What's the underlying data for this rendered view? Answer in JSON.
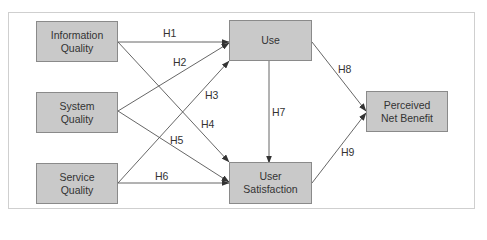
{
  "diagram": {
    "type": "path-model",
    "nodes": [
      {
        "id": "info",
        "line1": "Information",
        "line2": "Quality"
      },
      {
        "id": "sys",
        "line1": "System",
        "line2": "Quality"
      },
      {
        "id": "serv",
        "line1": "Service",
        "line2": "Quality"
      },
      {
        "id": "use",
        "line1": "Use",
        "line2": ""
      },
      {
        "id": "usat",
        "line1": "User",
        "line2": "Satisfaction"
      },
      {
        "id": "pnb",
        "line1": "Perceived",
        "line2": "Net Benefit"
      }
    ],
    "edges": [
      {
        "label": "H1",
        "from": "Information Quality",
        "to": "Use"
      },
      {
        "label": "H2",
        "from": "System Quality",
        "to": "Use"
      },
      {
        "label": "H3",
        "from": "Service Quality",
        "to": "Use"
      },
      {
        "label": "H4",
        "from": "Information Quality",
        "to": "User Satisfaction"
      },
      {
        "label": "H5",
        "from": "System Quality",
        "to": "User Satisfaction"
      },
      {
        "label": "H6",
        "from": "Service Quality",
        "to": "User Satisfaction"
      },
      {
        "label": "H7",
        "from": "Use",
        "to": "User Satisfaction"
      },
      {
        "label": "H8",
        "from": "Use",
        "to": "Perceived Net Benefit"
      },
      {
        "label": "H9",
        "from": "User Satisfaction",
        "to": "Perceived Net Benefit"
      }
    ],
    "colors": {
      "box_fill": "#c9c9c9",
      "box_border": "#8a8a8a",
      "line": "#444444",
      "text": "#333333",
      "frame": "#cfcfcf"
    }
  }
}
